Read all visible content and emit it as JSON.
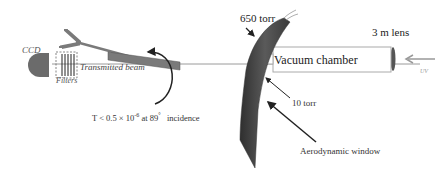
{
  "diagram": {
    "title": "",
    "labels": {
      "ccd": "CCD",
      "filters": "Filters",
      "transmitted_beam": "Transmitted beam",
      "pressure_high": "650 torr",
      "pressure_low": "10 torr",
      "vacuum_chamber": "Vacuum chamber",
      "lens": "3 m lens",
      "uv": "UV",
      "aerodynamic_window": "Aerodynamic window",
      "transmission_prefix": "T < 0.5 × 10",
      "transmission_exponent": "-6",
      "transmission_angle": " at 89",
      "transmission_degree": "°",
      "transmission_suffix": "   incidence"
    },
    "components": [
      {
        "id": "ccd",
        "type": "detector",
        "color": "#6b6b6b"
      },
      {
        "id": "filters",
        "type": "filter-stack",
        "count": 5
      },
      {
        "id": "plate",
        "type": "reflector-plate",
        "color": "#7a7a7a"
      },
      {
        "id": "aerodynamic-window",
        "type": "gas-jet",
        "color": "#4a4a4a"
      },
      {
        "id": "vacuum-chamber",
        "type": "box"
      },
      {
        "id": "lens",
        "type": "lens",
        "focal": "3 m"
      }
    ],
    "colors": {
      "beam": "#8a8a8a",
      "window_dark": "#3d3d3d",
      "arrow": "#222222"
    }
  }
}
